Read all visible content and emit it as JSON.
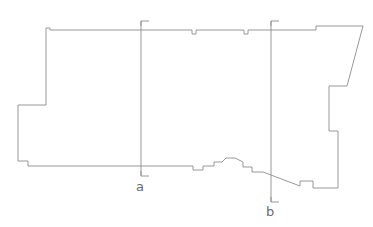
{
  "figure": {
    "kind": "architectural-plan-outline",
    "background_color": "#ffffff",
    "outline_color": "#8c8c8c",
    "section_line_color": "#8c8c8c",
    "label_color": "#6a6a6a",
    "canvas": {
      "width": 373,
      "height": 227
    }
  },
  "outline": {
    "name": "building-footprint",
    "stroke_width": 0.9,
    "points": "46,33 46,28 50,28 50,30 192,30 192,34 196,34 196,30 244,30 244,34 248,34 248,30 316,30 316,26 363,26 347,86 329,86 329,131 338,131 338,188 313,188 313,181 300,181 300,186 263,172 252,172 252,167 243,167 243,162 235,158 226,158 222,162 214,162 214,166 203,166 203,170 193,170 193,166 28,166 28,161 18,161 18,105 46,105 46,33"
  },
  "sections": [
    {
      "id": "a",
      "name": "section-line-a",
      "label": "a",
      "x": 141,
      "y_top": 21,
      "y_bottom": 176,
      "tick_top": "141,26 141,21 149,21",
      "tick_bottom": "141,171 141,176 149,176",
      "label_x": 136,
      "label_y": 180
    },
    {
      "id": "b",
      "name": "section-line-b",
      "label": "b",
      "x": 271,
      "y_top": 21,
      "y_bottom": 202,
      "tick_top": "271,26 271,21 279,21",
      "tick_bottom": "271,197 271,202 279,202",
      "label_x": 266,
      "label_y": 205
    }
  ]
}
